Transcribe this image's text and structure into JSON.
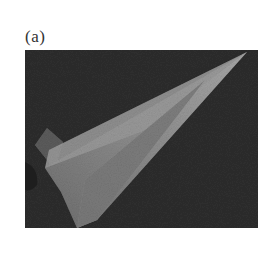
{
  "figure": {
    "label": "(a)",
    "colors": {
      "background": "#2e2e2e",
      "body_light": "#9a9a9a",
      "body_mid": "#7a7a7a",
      "body_dark": "#5c5c5c"
    }
  }
}
